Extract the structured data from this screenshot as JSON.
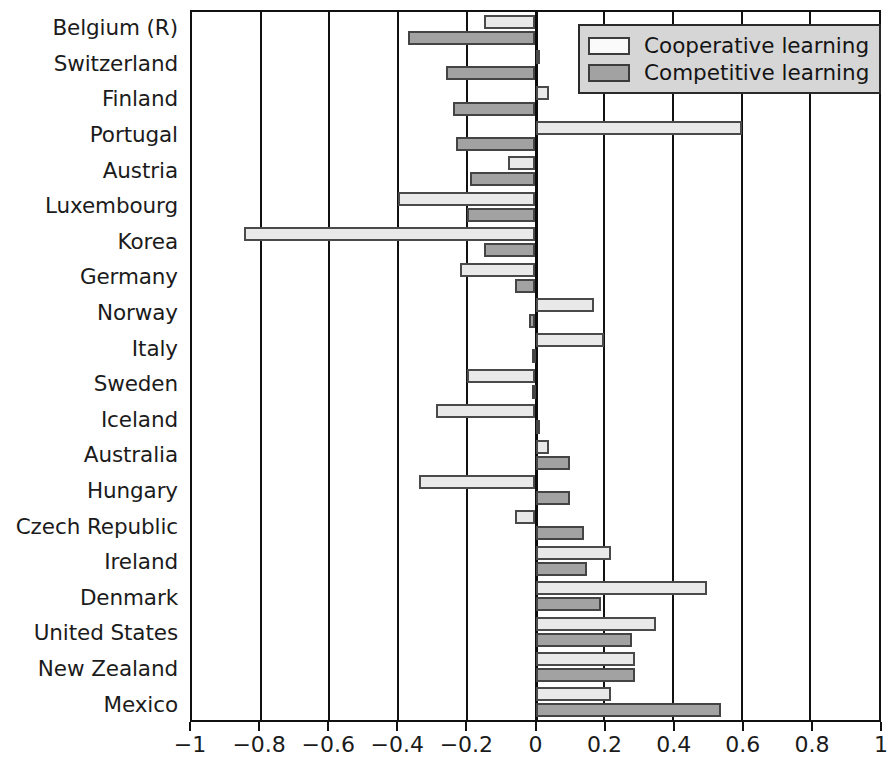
{
  "chart_data": {
    "type": "bar",
    "orientation": "horizontal",
    "title": "",
    "xlabel": "",
    "ylabel": "",
    "xlim": [
      -1,
      1
    ],
    "xticks": [
      -1,
      -0.8,
      -0.6,
      -0.4,
      -0.2,
      0,
      0.2,
      0.4,
      0.6,
      0.8,
      1
    ],
    "xticklabels": [
      "−1",
      "−0.8",
      "−0.6",
      "−0.4",
      "−0.2",
      "0",
      "0.2",
      "0.4",
      "0.6",
      "0.8",
      "1"
    ],
    "grid": true,
    "legend_position": "top-right",
    "categories": [
      "Belgium (R)",
      "Switzerland",
      "Finland",
      "Portugal",
      "Austria",
      "Luxembourg",
      "Korea",
      "Germany",
      "Norway",
      "Italy",
      "Sweden",
      "Iceland",
      "Australia",
      "Hungary",
      "Czech Republic",
      "Ireland",
      "Denmark",
      "United States",
      "New Zealand",
      "Mexico"
    ],
    "series": [
      {
        "name": "Cooperative learning",
        "color": "#e9e9e9",
        "values": [
          -0.15,
          0.01,
          0.04,
          0.6,
          -0.08,
          -0.4,
          -0.85,
          -0.22,
          0.17,
          0.2,
          -0.2,
          -0.29,
          0.04,
          -0.34,
          -0.06,
          0.22,
          0.5,
          0.35,
          0.29,
          0.22
        ]
      },
      {
        "name": "Competitive learning",
        "color": "#a2a2a2",
        "values": [
          -0.37,
          -0.26,
          -0.24,
          -0.23,
          -0.19,
          -0.2,
          -0.15,
          -0.06,
          -0.02,
          -0.01,
          -0.01,
          0.01,
          0.1,
          0.1,
          0.14,
          0.15,
          0.19,
          0.28,
          0.29,
          0.54
        ]
      }
    ]
  },
  "legend": {
    "items": [
      {
        "label": "Cooperative learning",
        "swatch": "cooperative-swatch"
      },
      {
        "label": "Competitive learning",
        "swatch": "competitive-swatch"
      }
    ]
  }
}
